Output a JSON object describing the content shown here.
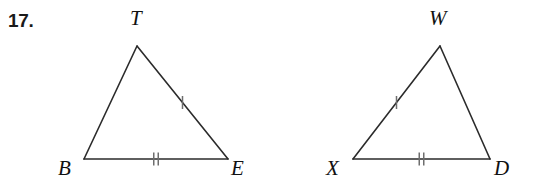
{
  "problem": {
    "number": "17."
  },
  "style": {
    "stroke_color": "#2b2b2b",
    "tick_color": "#6e6e6e",
    "label_color": "#111111",
    "background": "#ffffff",
    "stroke_width": 1.6,
    "tick_width": 1.5
  },
  "figures": [
    {
      "id": "triangle-bte",
      "name": "triangle-bte",
      "vertices": [
        {
          "label": "B",
          "name": "vertex-label-b",
          "x": 84,
          "y": 159,
          "label_x": 58,
          "label_y": 158
        },
        {
          "label": "T",
          "name": "vertex-label-t",
          "x": 137,
          "y": 46,
          "label_x": 130,
          "label_y": 8
        },
        {
          "label": "E",
          "name": "vertex-label-e",
          "x": 228,
          "y": 159,
          "label_x": 231,
          "label_y": 158
        }
      ],
      "sides": [
        {
          "name": "side-bt",
          "from": "B",
          "to": "T",
          "ticks": 0
        },
        {
          "name": "side-te",
          "from": "T",
          "to": "E",
          "ticks": 1
        },
        {
          "name": "side-be",
          "from": "B",
          "to": "E",
          "ticks": 2
        }
      ]
    },
    {
      "id": "triangle-xwd",
      "name": "triangle-xwd",
      "vertices": [
        {
          "label": "X",
          "name": "vertex-label-x",
          "x": 353,
          "y": 159,
          "label_x": 326,
          "label_y": 158
        },
        {
          "label": "W",
          "name": "vertex-label-w",
          "x": 440,
          "y": 46,
          "label_x": 429,
          "label_y": 8
        },
        {
          "label": "D",
          "name": "vertex-label-d",
          "x": 490,
          "y": 159,
          "label_x": 494,
          "label_y": 158
        }
      ],
      "sides": [
        {
          "name": "side-xw",
          "from": "X",
          "to": "W",
          "ticks": 1
        },
        {
          "name": "side-wd",
          "from": "W",
          "to": "D",
          "ticks": 0
        },
        {
          "name": "side-xd",
          "from": "X",
          "to": "D",
          "ticks": 2
        }
      ]
    }
  ]
}
